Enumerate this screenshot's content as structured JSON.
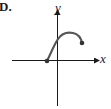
{
  "figure": {
    "part_label": "D.",
    "axes": {
      "x_label": "x",
      "y_label": "y"
    },
    "curve": {
      "description": "Curve starting at a closed point on the negative x-axis, rising through the y-axis to a maximum, then decreasing to a closed endpoint in the first quadrant",
      "start_point": {
        "type": "closed",
        "approx_x": -1,
        "approx_y": 0
      },
      "end_point": {
        "type": "closed",
        "approx_x": 2.5,
        "approx_y": 1.7
      },
      "maximum": {
        "approx_x": 1.5,
        "approx_y": 2.7
      }
    },
    "colors": {
      "axis": "#1a1a1a",
      "curve": "#555555",
      "point": "#333333"
    }
  }
}
